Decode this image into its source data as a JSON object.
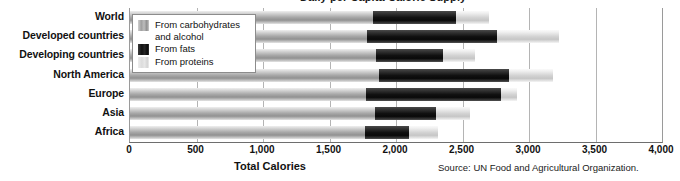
{
  "chart_data": {
    "type": "bar",
    "orientation": "horizontal",
    "stacked": true,
    "title": "Daily per Capita Calorie Supply",
    "xlabel": "Total Calories",
    "ylabel": "",
    "xlim": [
      0,
      4000
    ],
    "grid": true,
    "legend_position": "top-left-overlay",
    "categories": [
      "World",
      "Developed countries",
      "Developing countries",
      "North America",
      "Europe",
      "Asia",
      "Africa"
    ],
    "series": [
      {
        "name": "From carbohydrates and alcohol",
        "values": [
          1827,
          1782,
          1850,
          1872,
          1774,
          1842,
          1767
        ]
      },
      {
        "name": "From fats",
        "values": [
          624,
          978,
          504,
          978,
          1016,
          458,
          331
        ]
      },
      {
        "name": "From proteins",
        "values": [
          249,
          466,
          240,
          330,
          120,
          260,
          218
        ]
      }
    ],
    "totals": [
      2700,
      3226,
      2594,
      3180,
      2910,
      2560,
      2316
    ],
    "xticks": [
      0,
      500,
      1000,
      1500,
      2000,
      2500,
      3000,
      3500,
      4000
    ],
    "xtick_labels": [
      "0",
      "500",
      "1,000",
      "1,500",
      "2,000",
      "2,500",
      "3,000",
      "3,500",
      "4,000"
    ],
    "source": "Source: UN Food and Agricultural Organization.",
    "colors": {
      "carbohydrates": "#a0a0a0",
      "fats": "#111111",
      "proteins": "#dcdcdc",
      "gridline": "#b4b4b4",
      "axis": "#6e6e6e"
    }
  },
  "legend": {
    "items": [
      {
        "label": "From carbohydrates\nand alcohol",
        "swatch": "carbohydrates-swatch"
      },
      {
        "label": "From fats",
        "swatch": "fats-swatch"
      },
      {
        "label": "From proteins",
        "swatch": "proteins-swatch"
      }
    ]
  }
}
